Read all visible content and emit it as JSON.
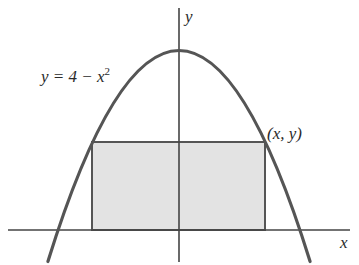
{
  "diagram": {
    "curve_label": "y = 4 − x",
    "curve_label_exponent": "2",
    "point_label": "(x, y)",
    "x_axis_label": "x",
    "y_axis_label": "y",
    "colors": {
      "curve": "#555555",
      "axes": "#444444",
      "rect_fill": "#e3e3e3",
      "rect_stroke": "#555555"
    },
    "equation": "y = 4 - x^2",
    "rectangle": {
      "description": "Rectangle inscribed under parabola with base on x-axis, upper corners on curve",
      "corner": "(x, y)"
    }
  }
}
